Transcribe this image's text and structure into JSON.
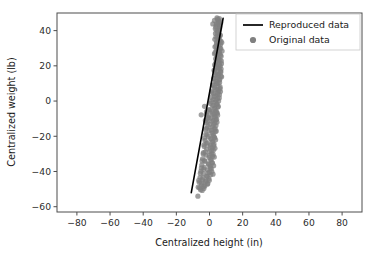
{
  "chart_data": {
    "type": "scatter",
    "title": "",
    "xlabel": "Centralized height (in)",
    "ylabel": "Centralized weight (lb)",
    "xlim": [
      -92,
      92
    ],
    "ylim": [
      -63,
      50
    ],
    "xticks": [
      -80,
      -60,
      -40,
      -20,
      0,
      20,
      40,
      60,
      80
    ],
    "xticklabels": [
      "−80",
      "−60",
      "−40",
      "−20",
      "0",
      "20",
      "40",
      "60",
      "80"
    ],
    "yticks": [
      40,
      20,
      0,
      -20,
      -40,
      -60
    ],
    "yticklabels": [
      "40",
      "20",
      "0",
      "−20",
      "−40",
      "−60"
    ],
    "grid": false,
    "legend_position": "upper right",
    "marker_color": "#808080",
    "line_color": "#000000",
    "series": [
      {
        "name": "Reproduced data",
        "type": "line",
        "color": "#000000",
        "x": [
          -11.0,
          8.2
        ],
        "y": [
          -52.0,
          47.0
        ]
      },
      {
        "name": "Original data",
        "type": "scatter",
        "color": "#808080",
        "marker": "circle",
        "marker_size": 5.2,
        "alpha": 0.75,
        "points": [
          [
            4.8,
            46.5
          ],
          [
            5.6,
            45.2
          ],
          [
            4.2,
            44.0
          ],
          [
            5.9,
            43.0
          ],
          [
            3.8,
            42.1
          ],
          [
            6.1,
            41.4
          ],
          [
            4.5,
            40.2
          ],
          [
            5.2,
            39.1
          ],
          [
            3.6,
            38.4
          ],
          [
            6.4,
            37.6
          ],
          [
            4.9,
            36.8
          ],
          [
            5.8,
            36.0
          ],
          [
            3.2,
            35.1
          ],
          [
            6.0,
            34.4
          ],
          [
            4.4,
            33.6
          ],
          [
            5.4,
            32.9
          ],
          [
            6.6,
            32.0
          ],
          [
            3.9,
            31.2
          ],
          [
            5.0,
            30.5
          ],
          [
            6.8,
            29.8
          ],
          [
            4.1,
            29.0
          ],
          [
            5.7,
            28.3
          ],
          [
            3.4,
            27.6
          ],
          [
            6.2,
            27.0
          ],
          [
            4.7,
            26.2
          ],
          [
            7.0,
            25.5
          ],
          [
            5.1,
            24.8
          ],
          [
            3.7,
            24.0
          ],
          [
            6.3,
            23.4
          ],
          [
            4.3,
            22.6
          ],
          [
            5.5,
            21.9
          ],
          [
            7.2,
            21.2
          ],
          [
            3.1,
            20.5
          ],
          [
            6.5,
            19.8
          ],
          [
            4.6,
            19.0
          ],
          [
            5.3,
            18.4
          ],
          [
            2.8,
            17.6
          ],
          [
            6.7,
            16.9
          ],
          [
            4.0,
            16.2
          ],
          [
            5.6,
            15.5
          ],
          [
            3.3,
            14.8
          ],
          [
            6.9,
            14.1
          ],
          [
            4.8,
            13.4
          ],
          [
            2.5,
            12.7
          ],
          [
            5.9,
            12.0
          ],
          [
            3.6,
            11.3
          ],
          [
            6.1,
            10.6
          ],
          [
            4.2,
            9.9
          ],
          [
            1.9,
            9.2
          ],
          [
            5.2,
            8.5
          ],
          [
            3.0,
            7.8
          ],
          [
            6.4,
            7.1
          ],
          [
            4.5,
            6.4
          ],
          [
            1.4,
            5.7
          ],
          [
            5.0,
            5.0
          ],
          [
            2.6,
            4.3
          ],
          [
            6.0,
            3.6
          ],
          [
            3.8,
            2.9
          ],
          [
            0.9,
            2.2
          ],
          [
            4.9,
            1.5
          ],
          [
            2.2,
            0.8
          ],
          [
            5.5,
            0.1
          ],
          [
            3.4,
            -0.6
          ],
          [
            0.4,
            -1.3
          ],
          [
            4.4,
            -2.0
          ],
          [
            1.8,
            -2.7
          ],
          [
            5.1,
            -3.4
          ],
          [
            3.0,
            -4.1
          ],
          [
            -0.2,
            -4.8
          ],
          [
            4.0,
            -5.5
          ],
          [
            1.3,
            -6.2
          ],
          [
            4.7,
            -6.9
          ],
          [
            2.6,
            -7.6
          ],
          [
            -1.9,
            -7.4
          ],
          [
            -0.7,
            -8.3
          ],
          [
            3.6,
            -9.0
          ],
          [
            0.8,
            -9.7
          ],
          [
            4.3,
            -10.4
          ],
          [
            2.2,
            -11.1
          ],
          [
            -1.2,
            -11.8
          ],
          [
            3.2,
            -12.5
          ],
          [
            0.3,
            -13.2
          ],
          [
            3.9,
            -13.9
          ],
          [
            1.8,
            -14.6
          ],
          [
            -1.7,
            -15.3
          ],
          [
            2.8,
            -16.0
          ],
          [
            -0.2,
            -16.7
          ],
          [
            3.5,
            -17.4
          ],
          [
            1.4,
            -18.1
          ],
          [
            -2.2,
            -18.8
          ],
          [
            2.4,
            -19.5
          ],
          [
            -0.7,
            -20.2
          ],
          [
            3.1,
            -20.9
          ],
          [
            1.0,
            -21.6
          ],
          [
            -2.7,
            -22.3
          ],
          [
            2.0,
            -23.0
          ],
          [
            -1.2,
            -23.7
          ],
          [
            2.7,
            -24.4
          ],
          [
            0.6,
            -25.1
          ],
          [
            -3.2,
            -25.8
          ],
          [
            1.6,
            -26.5
          ],
          [
            -1.7,
            -27.2
          ],
          [
            2.3,
            -27.9
          ],
          [
            0.2,
            -28.6
          ],
          [
            -3.7,
            -29.3
          ],
          [
            1.2,
            -30.0
          ],
          [
            -2.2,
            -30.7
          ],
          [
            1.9,
            -31.4
          ],
          [
            -0.2,
            -32.1
          ],
          [
            -4.2,
            -32.8
          ],
          [
            0.8,
            -33.5
          ],
          [
            -2.7,
            -34.2
          ],
          [
            1.5,
            -34.9
          ],
          [
            -0.7,
            -35.6
          ],
          [
            -4.7,
            -36.3
          ],
          [
            0.4,
            -37.0
          ],
          [
            -3.2,
            -37.7
          ],
          [
            1.1,
            -38.4
          ],
          [
            -1.2,
            -39.1
          ],
          [
            -5.2,
            -39.8
          ],
          [
            0.0,
            -40.5
          ],
          [
            -3.7,
            -41.2
          ],
          [
            0.7,
            -41.9
          ],
          [
            -1.7,
            -42.6
          ],
          [
            -5.7,
            -43.3
          ],
          [
            -0.4,
            -44.0
          ],
          [
            -4.2,
            -44.7
          ],
          [
            -2.2,
            -45.4
          ],
          [
            -6.2,
            -46.1
          ],
          [
            -1.0,
            -46.8
          ],
          [
            -4.7,
            -47.5
          ],
          [
            -2.8,
            -48.2
          ],
          [
            -6.8,
            -48.9
          ],
          [
            -3.4,
            -49.6
          ],
          [
            -5.4,
            -50.3
          ],
          [
            -7.0,
            -54.0
          ],
          [
            5.4,
            44.1
          ],
          [
            4.0,
            43.2
          ],
          [
            6.2,
            42.4
          ],
          [
            3.5,
            41.0
          ],
          [
            5.7,
            40.0
          ],
          [
            4.6,
            38.8
          ],
          [
            6.5,
            37.2
          ],
          [
            3.9,
            36.4
          ],
          [
            5.1,
            35.6
          ],
          [
            6.9,
            34.0
          ],
          [
            4.2,
            33.0
          ],
          [
            5.6,
            31.8
          ],
          [
            3.3,
            30.8
          ],
          [
            6.3,
            30.0
          ],
          [
            4.8,
            28.8
          ],
          [
            5.9,
            27.8
          ],
          [
            3.0,
            26.8
          ],
          [
            6.6,
            26.0
          ],
          [
            4.4,
            25.0
          ],
          [
            5.3,
            23.8
          ],
          [
            7.1,
            22.8
          ],
          [
            3.7,
            21.6
          ],
          [
            6.0,
            20.8
          ],
          [
            4.1,
            19.6
          ],
          [
            5.8,
            18.8
          ],
          [
            2.9,
            17.2
          ],
          [
            6.8,
            16.4
          ],
          [
            4.6,
            15.2
          ],
          [
            5.4,
            14.4
          ],
          [
            3.2,
            13.0
          ],
          [
            6.2,
            12.4
          ],
          [
            4.0,
            11.0
          ],
          [
            5.1,
            10.0
          ],
          [
            2.3,
            8.8
          ],
          [
            6.4,
            8.0
          ],
          [
            3.5,
            6.8
          ],
          [
            5.6,
            6.0
          ],
          [
            1.7,
            4.8
          ],
          [
            4.9,
            4.0
          ],
          [
            2.9,
            2.6
          ],
          [
            5.9,
            1.8
          ],
          [
            3.8,
            0.4
          ],
          [
            1.0,
            -0.2
          ],
          [
            4.6,
            -1.4
          ],
          [
            2.4,
            -2.4
          ],
          [
            5.3,
            -3.0
          ],
          [
            3.3,
            -4.6
          ],
          [
            0.1,
            -5.2
          ],
          [
            4.2,
            -6.4
          ],
          [
            1.9,
            -7.0
          ],
          [
            4.9,
            -8.0
          ],
          [
            2.8,
            -8.8
          ],
          [
            -0.5,
            -9.4
          ],
          [
            3.8,
            -10.8
          ],
          [
            1.5,
            -11.5
          ],
          [
            4.5,
            -12.0
          ],
          [
            2.5,
            -13.6
          ],
          [
            -1.0,
            -14.2
          ],
          [
            3.4,
            -15.8
          ],
          [
            1.1,
            -16.4
          ],
          [
            4.1,
            -17.0
          ],
          [
            2.1,
            -18.5
          ],
          [
            -1.5,
            -19.2
          ],
          [
            3.0,
            -20.6
          ],
          [
            0.7,
            -21.2
          ],
          [
            3.7,
            -22.0
          ],
          [
            1.7,
            -23.4
          ],
          [
            -2.0,
            -24.0
          ],
          [
            2.6,
            -25.4
          ],
          [
            0.3,
            -26.0
          ],
          [
            3.3,
            -26.8
          ],
          [
            1.3,
            -28.2
          ],
          [
            -2.5,
            -28.9
          ],
          [
            2.2,
            -30.3
          ],
          [
            -0.1,
            -31.0
          ],
          [
            2.9,
            -31.8
          ],
          [
            0.9,
            -33.2
          ],
          [
            -3.0,
            -33.8
          ],
          [
            1.8,
            -35.2
          ],
          [
            -0.5,
            -35.9
          ],
          [
            2.5,
            -36.7
          ],
          [
            0.5,
            -38.0
          ],
          [
            -3.5,
            -38.7
          ],
          [
            1.4,
            -40.0
          ],
          [
            -0.9,
            -40.8
          ],
          [
            2.1,
            -41.5
          ],
          [
            -1.4,
            -42.9
          ],
          [
            -4.0,
            -43.6
          ],
          [
            -0.1,
            -45.0
          ],
          [
            -2.4,
            -45.8
          ],
          [
            -5.0,
            -46.5
          ],
          [
            -1.3,
            -47.2
          ],
          [
            -3.6,
            -48.5
          ],
          [
            -6.0,
            -49.3
          ],
          [
            -4.4,
            -50.8
          ],
          [
            -2.0,
            -12.2
          ],
          [
            -2.4,
            -16.2
          ],
          [
            -3.0,
            -21.0
          ],
          [
            -3.4,
            -24.8
          ],
          [
            -1.5,
            -10.0
          ],
          [
            7.4,
            33.2
          ],
          [
            7.6,
            28.4
          ],
          [
            7.0,
            18.2
          ],
          [
            7.3,
            13.8
          ],
          [
            6.6,
            5.4
          ],
          [
            -5.0,
            -7.8
          ],
          [
            -3.0,
            -3.0
          ],
          [
            2.0,
            43.8
          ],
          [
            3.0,
            45.8
          ],
          [
            6.0,
            46.8
          ],
          [
            4.5,
            47.2
          ],
          [
            5.5,
            46.0
          ],
          [
            6.8,
            44.5
          ],
          [
            -2.5,
            -11.0
          ],
          [
            -1.8,
            -6.0
          ],
          [
            -4.5,
            -34.0
          ],
          [
            -5.5,
            -41.0
          ],
          [
            -6.5,
            -45.0
          ],
          [
            -3.8,
            -30.0
          ],
          [
            -4.9,
            -38.0
          ]
        ]
      }
    ]
  },
  "legend": {
    "entries": [
      {
        "label": "Reproduced data",
        "marker": "line",
        "color": "#000000"
      },
      {
        "label": "Original data",
        "marker": "circle",
        "color": "#808080"
      }
    ]
  }
}
